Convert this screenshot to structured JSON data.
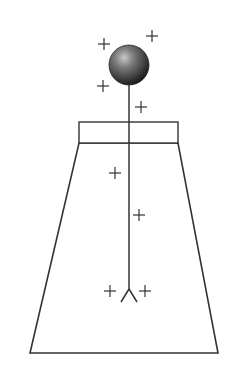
{
  "diagram": {
    "colors": {
      "stroke": "#333333",
      "background": "#ffffff",
      "ball_light": "#b8b8b8",
      "ball_dark": "#1a1a1a"
    },
    "components": {
      "ball": {
        "cx": 129,
        "cy": 65,
        "r": 20
      },
      "rod": {
        "x": 129,
        "y1": 85,
        "y2": 289
      },
      "stopper": {
        "x": 79,
        "y": 122,
        "w": 99,
        "h": 21
      },
      "flask": {
        "points": "79,143 178,143 218,353 30,353"
      },
      "leaves": {
        "apex_x": 129,
        "apex_y": 289,
        "left_x": 121,
        "right_x": 137,
        "bottom_y": 302
      }
    },
    "charges": [
      {
        "symbol": "+",
        "x": 104,
        "y": 44
      },
      {
        "symbol": "+",
        "x": 152,
        "y": 36
      },
      {
        "symbol": "+",
        "x": 103,
        "y": 86
      },
      {
        "symbol": "+",
        "x": 141,
        "y": 107
      },
      {
        "symbol": "+",
        "x": 115,
        "y": 173
      },
      {
        "symbol": "+",
        "x": 139,
        "y": 215
      },
      {
        "symbol": "+",
        "x": 110,
        "y": 291
      },
      {
        "symbol": "+",
        "x": 145,
        "y": 291
      }
    ]
  }
}
